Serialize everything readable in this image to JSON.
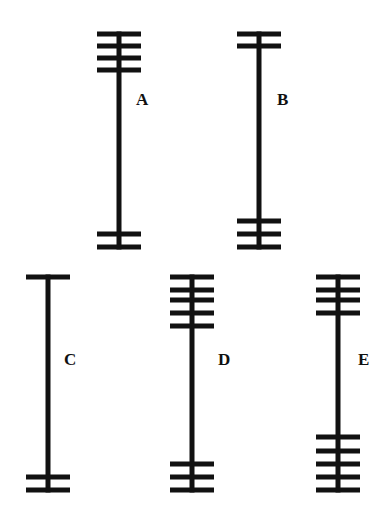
{
  "figure": {
    "background": "#ffffff",
    "ink_color": "#111111",
    "bar_width": 44,
    "bar_thickness": 5,
    "stem_thickness": 5,
    "items": [
      {
        "label": "A",
        "stem_x": 119,
        "top_y": 34,
        "bottom_y": 247,
        "top_bars": [
          34,
          46,
          58,
          70
        ],
        "bottom_bars": [
          234,
          247
        ],
        "label_x": 136,
        "label_y": 91
      },
      {
        "label": "B",
        "stem_x": 259,
        "top_y": 34,
        "bottom_y": 247,
        "top_bars": [
          34,
          46
        ],
        "bottom_bars": [
          221,
          234,
          247
        ],
        "label_x": 277,
        "label_y": 91
      },
      {
        "label": "C",
        "stem_x": 48,
        "top_y": 277,
        "bottom_y": 490,
        "top_bars": [
          277
        ],
        "bottom_bars": [
          477,
          490
        ],
        "label_x": 64,
        "label_y": 351
      },
      {
        "label": "D",
        "stem_x": 192,
        "top_y": 277,
        "bottom_y": 490,
        "top_bars": [
          277,
          290,
          300,
          313,
          326
        ],
        "bottom_bars": [
          464,
          477,
          490
        ],
        "label_x": 218,
        "label_y": 351
      },
      {
        "label": "E",
        "stem_x": 338,
        "top_y": 277,
        "bottom_y": 490,
        "top_bars": [
          277,
          290,
          300,
          313
        ],
        "bottom_bars": [
          437,
          451,
          464,
          477,
          490
        ],
        "label_x": 358,
        "label_y": 351
      }
    ]
  }
}
